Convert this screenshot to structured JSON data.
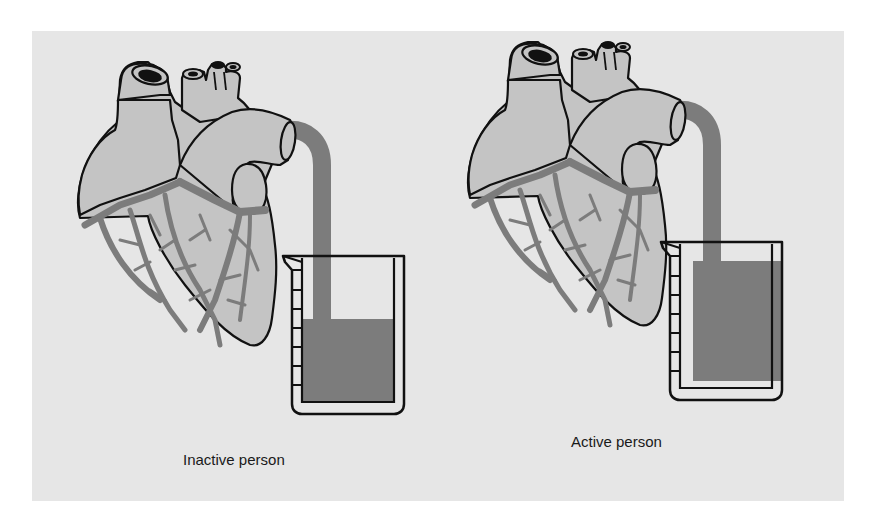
{
  "figure": {
    "colors": {
      "background": "#e6e6e6",
      "heart_fill": "#c4c4c4",
      "vessel_and_fluid": "#7c7c7c",
      "outline": "#111111"
    },
    "panels": [
      {
        "label": "Inactive person",
        "beaker_fill_fraction": 0.55
      },
      {
        "label": "Active person",
        "beaker_fill_fraction": 0.88
      }
    ]
  }
}
